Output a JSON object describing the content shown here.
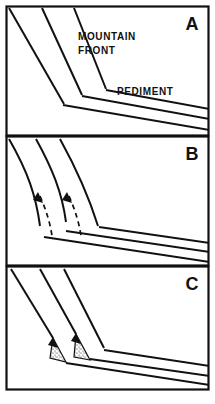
{
  "figure": {
    "name": "pediment-mountain-front-evolution",
    "type": "geologic-cross-section-sequence",
    "background": "#ffffff",
    "ink_color": "#111111",
    "width": 215,
    "height": 404
  },
  "panels": [
    {
      "id": "A",
      "letter": "A",
      "stage": "initial mountain front and pediment",
      "labels": [
        {
          "name": "mountain-front-label",
          "line1": "MOUNTAIN",
          "line2": "FRONT",
          "x": 78,
          "y": 36
        },
        {
          "name": "pediment-label",
          "text": "PEDIMENT",
          "x": 117,
          "y": 92
        }
      ],
      "has_dashed_former_positions": false,
      "has_arrowheads": false,
      "has_stipple_deposits": false,
      "frame": {
        "x": 6,
        "y": 6,
        "w": 203,
        "h": 130
      }
    },
    {
      "id": "B",
      "letter": "B",
      "stage": "scarp retreat with former positions shown dashed",
      "labels": [],
      "has_dashed_former_positions": true,
      "has_arrowheads": true,
      "has_stipple_deposits": false,
      "frame": {
        "x": 6,
        "y": 136,
        "w": 203,
        "h": 130
      }
    },
    {
      "id": "C",
      "letter": "C",
      "stage": "alluvial wedges deposited at mountain base",
      "labels": [],
      "has_dashed_former_positions": false,
      "has_arrowheads": true,
      "has_stipple_deposits": true,
      "frame": {
        "x": 6,
        "y": 266,
        "w": 203,
        "h": 124
      }
    }
  ],
  "legend_text": {
    "mountain_front": "MOUNTAIN FRONT",
    "pediment": "PEDIMENT"
  }
}
